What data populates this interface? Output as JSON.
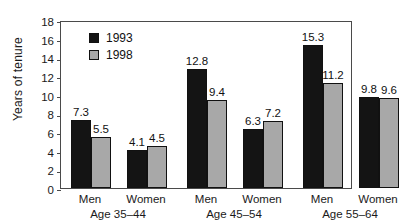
{
  "chart_data": {
    "type": "bar",
    "title": "",
    "xlabel": "",
    "ylabel": "Years of tenure",
    "ylim": [
      0,
      18
    ],
    "ytick_step": 2,
    "yticks": [
      "0",
      "2",
      "4",
      "6",
      "8",
      "10",
      "12",
      "14",
      "16",
      "18"
    ],
    "grid": false,
    "legend_position": "top-left-inside",
    "categories": [
      "Men",
      "Women",
      "Men",
      "Women",
      "Men",
      "Women"
    ],
    "groups": [
      {
        "age": "Age 35–44",
        "bars": [
          {
            "sex": "Men",
            "values": [
              7.3,
              5.5
            ]
          },
          {
            "sex": "Women",
            "values": [
              4.1,
              4.5
            ]
          }
        ]
      },
      {
        "age": "Age 45–54",
        "bars": [
          {
            "sex": "Men",
            "values": [
              12.8,
              9.4
            ]
          },
          {
            "sex": "Women",
            "values": [
              6.3,
              7.2
            ]
          }
        ]
      },
      {
        "age": "Age 55–64",
        "bars": [
          {
            "sex": "Men",
            "values": [
              15.3,
              11.2
            ]
          },
          {
            "sex": "Women",
            "values": [
              9.8,
              9.6
            ]
          }
        ]
      }
    ],
    "series": [
      {
        "name": "1993",
        "color": "#141414",
        "values": [
          7.3,
          4.1,
          12.8,
          6.3,
          15.3,
          9.8
        ]
      },
      {
        "name": "1998",
        "color": "#a8a8a8",
        "values": [
          5.5,
          4.5,
          9.4,
          7.2,
          11.2,
          9.6
        ]
      }
    ]
  },
  "legend": {
    "items": [
      {
        "label": "1993",
        "swatch": "black-square-swatch"
      },
      {
        "label": "1998",
        "swatch": "gray-square-swatch"
      }
    ]
  },
  "axis": {
    "y_title": "Years of tenure"
  }
}
